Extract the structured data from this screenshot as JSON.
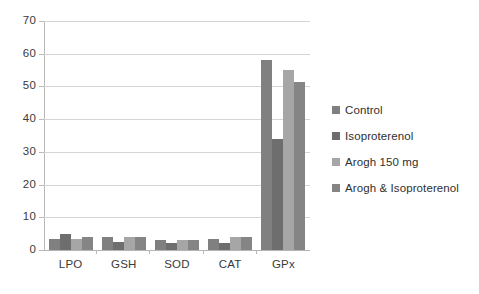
{
  "chart_data": {
    "type": "bar",
    "title": "",
    "xlabel": "",
    "ylabel": "",
    "ylim": [
      0,
      70
    ],
    "ytick_step": 10,
    "yticks": [
      70,
      60,
      50,
      40,
      30,
      20,
      10,
      0
    ],
    "ytick_labels": [
      "70",
      "60",
      "50",
      "40",
      "30",
      "20",
      "10",
      "0"
    ],
    "grid": true,
    "legend_position": "right",
    "categories": [
      "LPO",
      "GSH",
      "SOD",
      "CAT",
      "GPx"
    ],
    "series": [
      {
        "name": "Control",
        "color": "#808080",
        "values": [
          3.5,
          4.0,
          3.0,
          3.5,
          58.0
        ]
      },
      {
        "name": "Isoproterenol",
        "color": "#6e6e6e",
        "values": [
          5.0,
          2.5,
          2.0,
          2.0,
          34.0
        ]
      },
      {
        "name": "Arogh 150 mg",
        "color": "#a6a6a6",
        "values": [
          3.5,
          4.0,
          3.0,
          4.0,
          55.0
        ]
      },
      {
        "name": "Arogh & Isoproterenol",
        "color": "#858585",
        "values": [
          4.0,
          4.0,
          3.0,
          4.0,
          51.5
        ]
      }
    ]
  },
  "legend": {
    "items": [
      {
        "label": "Control",
        "color": "#808080"
      },
      {
        "label": "Isoproterenol",
        "color": "#6e6e6e"
      },
      {
        "label": "Arogh 150 mg",
        "color": "#a6a6a6"
      },
      {
        "label": "Arogh & Isoproterenol",
        "color": "#858585"
      }
    ]
  },
  "axes": {
    "y_tick_labels": [
      "70",
      "60",
      "50",
      "40",
      "30",
      "20",
      "10",
      "0"
    ],
    "x_tick_labels": [
      "LPO",
      "GSH",
      "SOD",
      "CAT",
      "GPx"
    ]
  },
  "colors": {
    "gridline": "#d4d4d4",
    "axis": "#b9b9b9",
    "text": "#3a3a3a",
    "background": "#ffffff"
  }
}
